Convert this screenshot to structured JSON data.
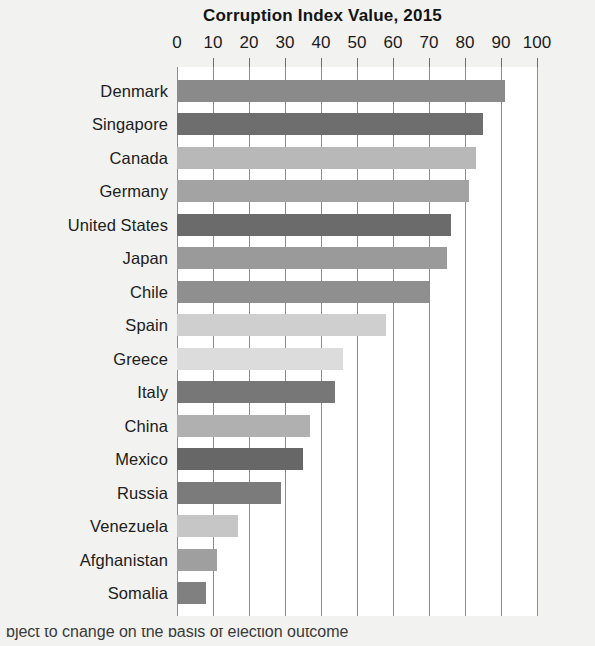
{
  "chart_data": {
    "type": "bar",
    "orientation": "horizontal",
    "title": "Corruption Index Value, 2015",
    "xlabel": "",
    "ylabel": "",
    "xlim": [
      0,
      100
    ],
    "xticks": [
      0,
      10,
      20,
      30,
      40,
      50,
      60,
      70,
      80,
      90,
      100
    ],
    "xtick_labels": [
      "0",
      "10",
      "20",
      "30",
      "40",
      "50",
      "60",
      "70",
      "80",
      "90",
      "100"
    ],
    "grid": true,
    "legend": false,
    "categories": [
      "Denmark",
      "Singapore",
      "Canada",
      "Germany",
      "United States",
      "Japan",
      "Chile",
      "Spain",
      "Greece",
      "Italy",
      "China",
      "Mexico",
      "Russia",
      "Venezuela",
      "Afghanistan",
      "Somalia"
    ],
    "values": [
      91,
      85,
      83,
      81,
      76,
      75,
      70,
      58,
      46,
      44,
      37,
      35,
      29,
      17,
      11,
      8
    ],
    "bar_colors": [
      "#8a8a8a",
      "#6e6e6e",
      "#b8b8b8",
      "#a3a3a3",
      "#6b6b6b",
      "#9a9a9a",
      "#8f8f8f",
      "#cfcfcf",
      "#dcdcdc",
      "#777777",
      "#b0b0b0",
      "#676767",
      "#7b7b7b",
      "#c6c6c6",
      "#9f9f9f",
      "#808080"
    ]
  },
  "axis": {
    "tick_color": "#6d6d6d",
    "gridline_color": "#8c8c8c"
  },
  "canvas": {
    "background": "#f2f2f0",
    "plot_background": "#ffffff"
  },
  "caption": {
    "text": "bject to change on the basis of election outcome"
  }
}
